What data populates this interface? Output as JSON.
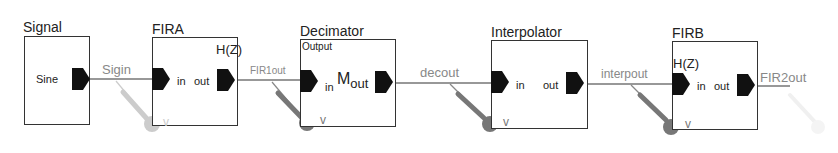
{
  "blocks": {
    "signal": {
      "title": "Signal",
      "port_out": "Sine"
    },
    "fira": {
      "title": "FIRA",
      "function": "H(Z)",
      "port_in": "in",
      "port_out": "out"
    },
    "decimator": {
      "title": "Decimator",
      "subtitle": "Output",
      "port_in": "in",
      "symbol": "M",
      "symbol_sub": "out"
    },
    "interpolator": {
      "title": "Interpolator",
      "port_in": "in",
      "port_out": "out"
    },
    "firb": {
      "title": "FIRB",
      "function": "H(Z)",
      "port_in": "in",
      "port_out": "out"
    }
  },
  "wires": [
    {
      "label": "Sigin",
      "probe": "v"
    },
    {
      "label": "FIR1out",
      "probe": "v"
    },
    {
      "label": "decout",
      "probe": "v"
    },
    {
      "label": "interpout",
      "probe": "v"
    },
    {
      "label": "FIR2out",
      "probe": ""
    }
  ],
  "colors": {
    "block_border": "#333333",
    "port_fill": "#111111",
    "wire_label": "#888888",
    "probe_dark": "#777777",
    "probe_light": "#cccccc",
    "probe_faint": "#eeeeee"
  }
}
